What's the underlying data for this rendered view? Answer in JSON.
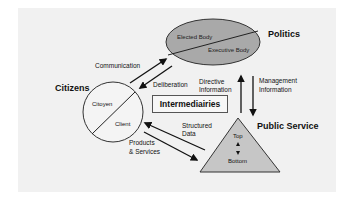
{
  "diagram": {
    "nodes": {
      "politics": {
        "label": "Politics",
        "upper": "Elected Body",
        "lower": "Executive Body",
        "shape": "ellipse",
        "fill": "#a9a9a9"
      },
      "citizens": {
        "label": "Citizens",
        "upper": "Citoyen",
        "lower": "Client",
        "shape": "circle",
        "fill": "#f4f4f4"
      },
      "intermediaries": {
        "label": "Intermediairies",
        "shape": "box"
      },
      "public_service": {
        "label": "Public Service",
        "top": "Top",
        "bottom": "Bottom",
        "shape": "triangle",
        "fill": "#c6c6c6"
      }
    },
    "edges": {
      "communication": "Communication",
      "deliberation": "Deliberation",
      "directive_info_1": "Directive",
      "directive_info_2": "Information",
      "management_info_1": "Management",
      "management_info_2": "Information",
      "structured_data_1": "Structured",
      "structured_data_2": "Data",
      "products_services_1": "Products",
      "products_services_2": "& Services"
    },
    "colors": {
      "background": "#f1f1f1",
      "line": "#222222"
    }
  }
}
